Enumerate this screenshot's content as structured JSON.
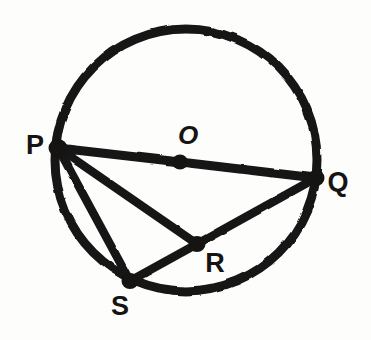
{
  "figure": {
    "kind": "geometry-diagram",
    "canvas": {
      "width": 371,
      "height": 340
    },
    "background_color": "#fdfdfc",
    "ink_color": "#151413"
  },
  "chart_data": {
    "type": "diagram",
    "title": "",
    "xlabel": "",
    "ylabel": "",
    "shapes": [
      {
        "name": "main-circle",
        "type": "circle",
        "center": {
          "x": 186,
          "y": 160
        },
        "radius": 131,
        "stroke_width": 9,
        "stroke": "#151413",
        "fill": "none"
      }
    ],
    "points": [
      {
        "id": "P",
        "label": "P",
        "x": 58,
        "y": 148,
        "on_circle": true,
        "label_x": 35,
        "label_y": 145,
        "marker": "dot"
      },
      {
        "id": "Q",
        "label": "Q",
        "x": 316,
        "y": 178,
        "on_circle": true,
        "label_x": 338,
        "label_y": 182,
        "marker": "dot"
      },
      {
        "id": "O",
        "label": "O",
        "x": 180,
        "y": 162,
        "on_circle": false,
        "label_x": 188,
        "label_y": 135,
        "marker": "dot"
      },
      {
        "id": "R",
        "label": "R",
        "x": 197,
        "y": 244,
        "on_circle": false,
        "label_x": 215,
        "label_y": 263,
        "marker": "dot"
      },
      {
        "id": "S",
        "label": "S",
        "x": 130,
        "y": 281,
        "on_circle": true,
        "label_x": 120,
        "label_y": 306,
        "marker": "dot"
      }
    ],
    "segments": [
      {
        "id": "PQ",
        "from": "P",
        "to": "Q",
        "through": "O",
        "note": "diameter"
      },
      {
        "id": "PR",
        "from": "P",
        "to": "R",
        "through": null,
        "note": "chord"
      },
      {
        "id": "PS",
        "from": "P",
        "to": "S",
        "through": null,
        "note": "chord"
      },
      {
        "id": "SR",
        "from": "S",
        "to": "R",
        "through": null,
        "note": "segment"
      },
      {
        "id": "RQ",
        "from": "R",
        "to": "Q",
        "through": null,
        "note": "segment"
      }
    ]
  },
  "labels": {
    "p": "P",
    "q": "Q",
    "o": "O",
    "r": "R",
    "s": "S"
  }
}
